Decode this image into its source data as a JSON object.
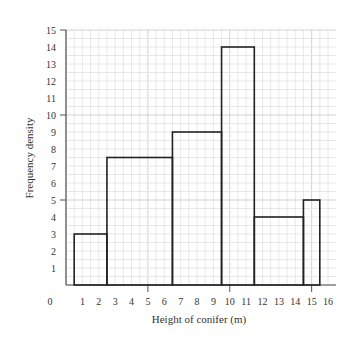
{
  "chart_data": {
    "type": "bar",
    "subtype": "histogram",
    "title": "",
    "xlabel": "Height of conifer (m)",
    "ylabel": "Frequency density",
    "xlim": [
      0,
      16
    ],
    "ylim": [
      0,
      15
    ],
    "x_ticks": [
      0,
      1,
      2,
      3,
      4,
      5,
      6,
      7,
      8,
      9,
      10,
      11,
      12,
      13,
      14,
      15,
      16
    ],
    "y_ticks": [
      1,
      2,
      3,
      4,
      5,
      6,
      7,
      8,
      9,
      10,
      11,
      12,
      13,
      14,
      15
    ],
    "grid": true,
    "legend": null,
    "bins": [
      {
        "x_start": 0.5,
        "x_end": 2.5,
        "value": 3
      },
      {
        "x_start": 2.5,
        "x_end": 6.5,
        "value": 7.5
      },
      {
        "x_start": 6.5,
        "x_end": 9.5,
        "value": 9
      },
      {
        "x_start": 9.5,
        "x_end": 11.5,
        "value": 14
      },
      {
        "x_start": 11.5,
        "x_end": 14.5,
        "value": 4
      },
      {
        "x_start": 14.5,
        "x_end": 15.5,
        "value": 5
      }
    ],
    "colors": {
      "bar_stroke": "#222222",
      "bar_fill": "none",
      "grid_minor": "#e2e2e2",
      "grid_major": "#c8c8c8",
      "axis": "#555555"
    }
  }
}
